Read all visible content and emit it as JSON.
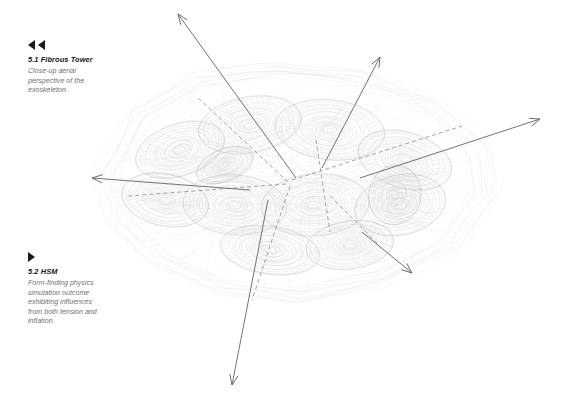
{
  "page": {
    "background_color": "#ffffff",
    "width": 569,
    "height": 408
  },
  "captions": [
    {
      "id": "fibrous-tower",
      "marker": "double-left-triangle",
      "marker_count": 2,
      "title": "5.1 Fibrous Tower",
      "body_lines": [
        "Close-up aerial",
        "perspective of the",
        "exoskeleton."
      ],
      "title_color": "#141414",
      "body_color": "#6f6f6f"
    },
    {
      "id": "hsm",
      "marker": "right-triangle",
      "marker_count": 1,
      "title": "5.2 HSM",
      "body_lines": [
        "Form-finding physics",
        "simulation outcome",
        "exhibiting influences",
        "from both tension and",
        "inflation."
      ],
      "title_color": "#141414",
      "body_color": "#6f6f6f"
    }
  ],
  "chart_data": {
    "type": "diagram",
    "mesh": {
      "stroke_color": "#b9bcc0",
      "stroke_color_dark": "#9a9ea3",
      "stroke_width": 0.45,
      "opacity": 0.55,
      "center": [
        290,
        185
      ],
      "cells": [
        {
          "cx": 180,
          "cy": 150,
          "rx": 46,
          "ry": 26,
          "rot": -18
        },
        {
          "cx": 250,
          "cy": 125,
          "rx": 52,
          "ry": 28,
          "rot": -10
        },
        {
          "cx": 330,
          "cy": 130,
          "rx": 55,
          "ry": 30,
          "rot": 6
        },
        {
          "cx": 405,
          "cy": 160,
          "rx": 48,
          "ry": 28,
          "rot": 16
        },
        {
          "cx": 165,
          "cy": 200,
          "rx": 44,
          "ry": 26,
          "rot": 12
        },
        {
          "cx": 235,
          "cy": 205,
          "rx": 52,
          "ry": 30,
          "rot": 4
        },
        {
          "cx": 315,
          "cy": 205,
          "rx": 54,
          "ry": 31,
          "rot": -4
        },
        {
          "cx": 400,
          "cy": 205,
          "rx": 46,
          "ry": 30,
          "rot": -12
        },
        {
          "cx": 270,
          "cy": 250,
          "rx": 50,
          "ry": 24,
          "rot": 8
        },
        {
          "cx": 350,
          "cy": 245,
          "rx": 44,
          "ry": 24,
          "rot": -8
        },
        {
          "cx": 225,
          "cy": 165,
          "rx": 30,
          "ry": 16,
          "rot": -22
        },
        {
          "cx": 395,
          "cy": 195,
          "rx": 26,
          "ry": 30,
          "rot": 10
        }
      ],
      "envelope": [
        [
          120,
          178
        ],
        [
          150,
          120
        ],
        [
          205,
          88
        ],
        [
          275,
          78
        ],
        [
          350,
          85
        ],
        [
          420,
          110
        ],
        [
          465,
          150
        ],
        [
          470,
          195
        ],
        [
          440,
          240
        ],
        [
          375,
          272
        ],
        [
          300,
          288
        ],
        [
          230,
          280
        ],
        [
          168,
          252
        ],
        [
          130,
          215
        ]
      ]
    },
    "axes": [
      {
        "name": "axis-up-left",
        "from": [
          296,
          178
        ],
        "to": [
          178,
          14
        ],
        "arrow": true,
        "style": "solid"
      },
      {
        "name": "axis-up-right",
        "from": [
          322,
          168
        ],
        "to": [
          380,
          57
        ],
        "arrow": true,
        "style": "solid"
      },
      {
        "name": "axis-right",
        "from": [
          360,
          178
        ],
        "to": [
          540,
          119
        ],
        "arrow": true,
        "style": "solid"
      },
      {
        "name": "axis-left",
        "from": [
          250,
          190
        ],
        "to": [
          92,
          178
        ],
        "arrow": true,
        "style": "solid"
      },
      {
        "name": "axis-down",
        "from": [
          268,
          200
        ],
        "to": [
          232,
          385
        ],
        "arrow": true,
        "style": "solid"
      },
      {
        "name": "axis-down-right",
        "from": [
          362,
          232
        ],
        "to": [
          412,
          273
        ],
        "arrow": true,
        "style": "solid"
      }
    ],
    "dashed_axes": [
      {
        "name": "dashed-up-left",
        "from": [
          288,
          182
        ],
        "to": [
          196,
          96
        ]
      },
      {
        "name": "dashed-right",
        "from": [
          292,
          180
        ],
        "to": [
          462,
          126
        ]
      },
      {
        "name": "dashed-left",
        "from": [
          286,
          184
        ],
        "to": [
          128,
          196
        ]
      },
      {
        "name": "dashed-down",
        "from": [
          290,
          186
        ],
        "to": [
          252,
          300
        ]
      },
      {
        "name": "dashed-vertical",
        "from": [
          316,
          140
        ],
        "to": [
          330,
          232
        ]
      },
      {
        "name": "dashed-diagonal",
        "from": [
          330,
          196
        ],
        "to": [
          378,
          244
        ]
      }
    ],
    "arrow_color": "#6a6d72",
    "dash_color": "#7f8286",
    "arrow_stroke_width": 1.0
  }
}
